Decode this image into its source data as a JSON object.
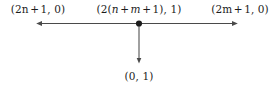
{
  "figure": {
    "type": "geometric-diagram",
    "background_color": "#ffffff",
    "line_color": "#4a4a4a",
    "text_color": "#1c1c1c",
    "labels": {
      "left": {
        "text": "(2n + 1, 0)",
        "parts": [
          "(2",
          "n",
          "+",
          "1, 0)"
        ]
      },
      "center": {
        "text": "(2(n + m + 1), 1)",
        "parts": [
          "(2(",
          "n",
          "+",
          "m",
          "+",
          "1), 1)"
        ]
      },
      "right": {
        "text": "(2m + 1, 0)",
        "parts": [
          "(2",
          "m",
          "+",
          "1, 0)"
        ]
      },
      "bottom": {
        "text": "(0, 1)",
        "parts": [
          "(0, 1)"
        ]
      }
    },
    "geometry": {
      "horizontal_axis": {
        "y": 23,
        "x_start": 36,
        "x_end": 238,
        "arrowhead_left": true,
        "arrowhead_right": true
      },
      "vertical_axis": {
        "x": 139,
        "y_start": 23,
        "y_end": 64,
        "arrowhead_down": true
      },
      "node_point": {
        "x": 139,
        "y": 23,
        "radius": 3.1,
        "filled": true
      }
    }
  }
}
